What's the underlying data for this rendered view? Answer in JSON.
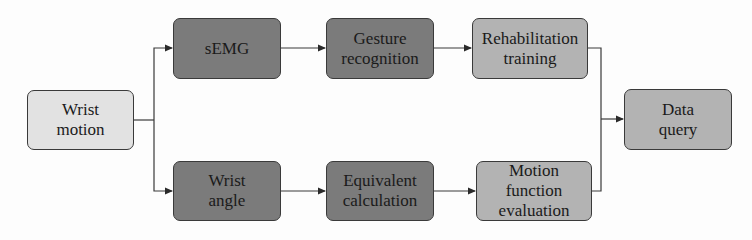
{
  "diagram": {
    "type": "flowchart",
    "colors": {
      "input": "#e2e2e2",
      "processing": "#7b7b7b",
      "output": "#b3b3b3",
      "line": "#3a3a3a"
    },
    "nodes": {
      "wrist_motion": {
        "lines": [
          "Wrist",
          "motion"
        ]
      },
      "semg": {
        "lines": [
          "sEMG"
        ]
      },
      "gesture_recognition": {
        "lines": [
          "Gesture",
          "recognition"
        ]
      },
      "rehabilitation_training": {
        "lines": [
          "Rehabilitation",
          "training"
        ]
      },
      "wrist_angle": {
        "lines": [
          "Wrist",
          "angle"
        ]
      },
      "equivalent_calculation": {
        "lines": [
          "Equivalent",
          "calculation"
        ]
      },
      "motion_function_evaluation": {
        "lines": [
          "Motion",
          "function",
          "evaluation"
        ]
      },
      "data_query": {
        "lines": [
          "Data",
          "query"
        ]
      }
    },
    "edges": [
      {
        "from": "wrist_motion",
        "to": "semg"
      },
      {
        "from": "wrist_motion",
        "to": "wrist_angle"
      },
      {
        "from": "semg",
        "to": "gesture_recognition"
      },
      {
        "from": "gesture_recognition",
        "to": "rehabilitation_training"
      },
      {
        "from": "wrist_angle",
        "to": "equivalent_calculation"
      },
      {
        "from": "equivalent_calculation",
        "to": "motion_function_evaluation"
      },
      {
        "from": "rehabilitation_training",
        "to": "data_query"
      },
      {
        "from": "motion_function_evaluation",
        "to": "data_query"
      }
    ]
  }
}
